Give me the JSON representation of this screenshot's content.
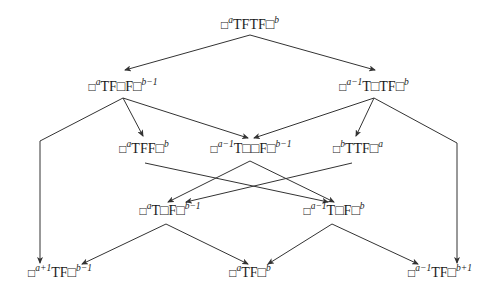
{
  "diagram": {
    "type": "directed-graph",
    "nodes": [
      {
        "id": "n0",
        "x": 250,
        "y": 27,
        "parts": [
          "□",
          "a",
          "TFTF□",
          "b"
        ]
      },
      {
        "id": "n1",
        "x": 123,
        "y": 89,
        "parts": [
          "□",
          "a",
          "TF□F□",
          "b−1"
        ]
      },
      {
        "id": "n2",
        "x": 374,
        "y": 89,
        "parts": [
          "□",
          "a−1",
          "T□TF□",
          "b"
        ]
      },
      {
        "id": "n3",
        "x": 144,
        "y": 151,
        "parts": [
          "□",
          "a",
          "TFF□",
          "b"
        ]
      },
      {
        "id": "n4",
        "x": 251,
        "y": 151,
        "parts": [
          "□",
          "a−1",
          "T□□F□",
          "b−1"
        ]
      },
      {
        "id": "n5",
        "x": 358,
        "y": 151,
        "parts": [
          "□",
          "b",
          "TTF□",
          "a"
        ]
      },
      {
        "id": "n6",
        "x": 170,
        "y": 213,
        "parts": [
          "□",
          "a",
          "T□F□",
          "b−1"
        ]
      },
      {
        "id": "n7",
        "x": 334,
        "y": 213,
        "parts": [
          "□",
          "a−1",
          "T□F□",
          "b"
        ]
      },
      {
        "id": "n8",
        "x": 60,
        "y": 275,
        "parts": [
          "□",
          "a+1",
          "TF□",
          "b−1"
        ]
      },
      {
        "id": "n9",
        "x": 250,
        "y": 275,
        "parts": [
          "□",
          "a",
          "TF□",
          "b"
        ]
      },
      {
        "id": "n10",
        "x": 440,
        "y": 275,
        "parts": [
          "□",
          "a−1",
          "TF□",
          "b+1"
        ]
      }
    ],
    "edges": [
      {
        "from": "n0",
        "to": "n1",
        "points": [
          [
            250,
            35
          ],
          [
            125,
            70
          ]
        ]
      },
      {
        "from": "n0",
        "to": "n2",
        "points": [
          [
            250,
            35
          ],
          [
            375,
            70
          ]
        ]
      },
      {
        "from": "n1",
        "to": "n8",
        "points": [
          [
            123,
            98
          ],
          [
            40,
            141
          ],
          [
            40,
            263
          ]
        ]
      },
      {
        "from": "n1",
        "to": "n3",
        "points": [
          [
            123,
            98
          ],
          [
            143,
            136
          ]
        ]
      },
      {
        "from": "n1",
        "to": "n4",
        "points": [
          [
            123,
            98
          ],
          [
            248,
            138
          ]
        ]
      },
      {
        "from": "n2",
        "to": "n4",
        "points": [
          [
            374,
            98
          ],
          [
            254,
            138
          ]
        ]
      },
      {
        "from": "n2",
        "to": "n5",
        "points": [
          [
            374,
            98
          ],
          [
            356,
            136
          ]
        ]
      },
      {
        "from": "n2",
        "to": "n10",
        "points": [
          [
            374,
            98
          ],
          [
            457,
            143
          ],
          [
            457,
            263
          ]
        ]
      },
      {
        "from": "n3",
        "to": "n7",
        "points": [
          [
            145,
            163
          ],
          [
            328,
            202
          ]
        ]
      },
      {
        "from": "n4",
        "to": "n6",
        "points": [
          [
            250,
            161
          ],
          [
            168,
            202
          ]
        ]
      },
      {
        "from": "n4",
        "to": "n7",
        "points": [
          [
            250,
            161
          ],
          [
            334,
            202
          ]
        ]
      },
      {
        "from": "n5",
        "to": "n6",
        "points": [
          [
            352,
            163
          ],
          [
            186,
            202
          ]
        ]
      },
      {
        "from": "n6",
        "to": "n8",
        "points": [
          [
            166,
            224
          ],
          [
            82,
            264
          ]
        ]
      },
      {
        "from": "n6",
        "to": "n9",
        "points": [
          [
            166,
            224
          ],
          [
            248,
            264
          ]
        ]
      },
      {
        "from": "n7",
        "to": "n9",
        "points": [
          [
            332,
            224
          ],
          [
            268,
            264
          ]
        ]
      },
      {
        "from": "n7",
        "to": "n10",
        "points": [
          [
            332,
            224
          ],
          [
            418,
            264
          ]
        ]
      }
    ],
    "colors": {
      "line": "#333333",
      "text": "#1a1a1a",
      "background": "#ffffff"
    }
  }
}
